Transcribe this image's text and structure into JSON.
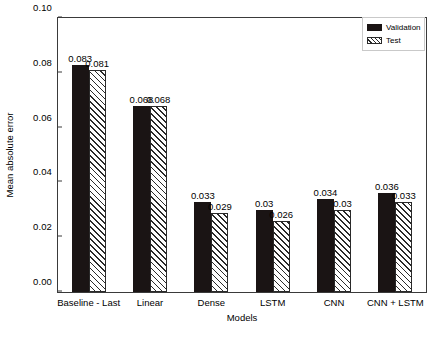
{
  "chart_data": {
    "type": "bar",
    "title": "",
    "xlabel": "Models",
    "ylabel": "Mean absolute error",
    "categories": [
      "Baseline - Last",
      "Linear",
      "Dense",
      "LSTM",
      "CNN",
      "CNN + LSTM"
    ],
    "series": [
      {
        "name": "Validation",
        "values": [
          0.083,
          0.068,
          0.033,
          0.03,
          0.034,
          0.036
        ],
        "labels": [
          "0.083",
          "0.068",
          "0.033",
          "0.03",
          "0.034",
          "0.036"
        ],
        "style": "solid-black",
        "color": "#1a1414"
      },
      {
        "name": "Test",
        "values": [
          0.081,
          0.068,
          0.029,
          0.026,
          0.03,
          0.033
        ],
        "labels": [
          "0.081",
          "0.068",
          "0.029",
          "0.026",
          "0.03",
          "0.033"
        ],
        "style": "diagonal-hatch",
        "color": "#ffffff"
      }
    ],
    "ylim": [
      0.0,
      0.1
    ],
    "yticks": [
      0.0,
      0.02,
      0.04,
      0.06,
      0.08,
      0.1
    ],
    "ytick_labels": [
      "0.00",
      "0.02",
      "0.04",
      "0.06",
      "0.08",
      "0.10"
    ],
    "grid": false,
    "legend_position": "top-right",
    "legend_entries": [
      "Validation",
      "Test"
    ]
  }
}
